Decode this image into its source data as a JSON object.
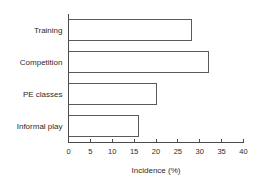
{
  "chart_data": {
    "type": "bar",
    "orientation": "horizontal",
    "title": "",
    "xlabel": "Incidence (%)",
    "ylabel": "",
    "categories": [
      "Training",
      "Competition",
      "PE classes",
      "Informal play"
    ],
    "values": [
      28,
      32,
      20,
      16
    ],
    "xlim": [
      0,
      40
    ],
    "xticks": [
      0,
      5,
      10,
      15,
      20,
      25,
      30,
      35,
      40
    ],
    "xtick_labels": [
      "0",
      "5",
      "10",
      "15",
      "20",
      "25",
      "30",
      "35",
      "40"
    ],
    "grid": false,
    "legend": false,
    "bar_fill": "#ffffff",
    "bar_stroke": "#5a5a5a",
    "axis_color": "#4a4a4a",
    "text_color": "#2b2b2b",
    "background": "#ffffff"
  }
}
